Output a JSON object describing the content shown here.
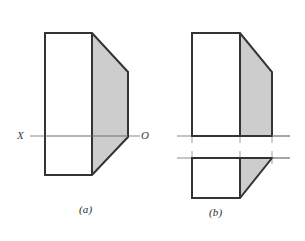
{
  "figure": {
    "colors": {
      "shaded_fill": "#cdcdcd",
      "outline": "#333333",
      "axis_line": "#8c8c8c",
      "background": "#ffffff",
      "text": "#2b2b2b"
    },
    "captions": {
      "a": "(a)",
      "b": "(b)"
    },
    "axis_labels": {
      "x": "X",
      "o": "O"
    },
    "panel_a": {
      "name": "combined-view",
      "body_outline": "45,33 92,33 128,72 128,137 92,175 45,175",
      "white_region": "45,33 92,33 92,175 45,175",
      "shaded_region": "92,33 128,72 128,137 92,175",
      "inner_vertical": {
        "x": 92,
        "y1": 33,
        "y2": 175
      },
      "axis": {
        "x1": 30,
        "x2": 140,
        "y": 136
      }
    },
    "panel_b": {
      "name": "separated-views",
      "upper": {
        "body_outline": "192,33 240,33 272,72 272,136 192,136",
        "white_region": "192,33 240,33 240,136 192,136",
        "shaded_region": "240,33 272,72 272,136 240,136",
        "inner_vertical": {
          "x": 240,
          "y1": 33,
          "y2": 136
        },
        "baseline": {
          "x1": 192,
          "x2": 272,
          "y": 136
        }
      },
      "lower": {
        "body_outline": "192,158 272,158 240,198 192,198",
        "white_region": "192,158 240,158 240,198 192,198",
        "shaded_region": "240,158 272,158 240,198",
        "inner_vertical": {
          "x": 240,
          "y1": 158,
          "y2": 198
        },
        "topline": {
          "x1": 192,
          "x2": 272,
          "y": 158
        }
      },
      "axis_upper": {
        "x1": 177,
        "x2": 290,
        "y": 136
      },
      "axis_lower": {
        "x1": 177,
        "x2": 290,
        "y": 158
      },
      "tick_marks": [
        {
          "x": 192,
          "y1": 130,
          "y2": 143
        },
        {
          "x": 240,
          "y1": 130,
          "y2": 143
        },
        {
          "x": 272,
          "y1": 130,
          "y2": 143
        },
        {
          "x": 192,
          "y1": 151,
          "y2": 164
        },
        {
          "x": 240,
          "y1": 151,
          "y2": 164
        },
        {
          "x": 272,
          "y1": 151,
          "y2": 164
        }
      ]
    }
  }
}
